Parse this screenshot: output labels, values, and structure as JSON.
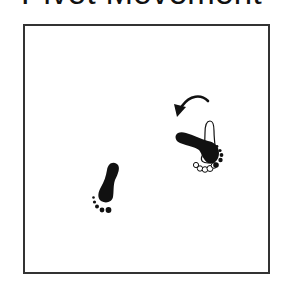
{
  "title": "Pivot Movement",
  "diagram": {
    "colors": {
      "ink": "#111111",
      "frame": "#333333",
      "background": "#ffffff"
    },
    "elements": [
      {
        "name": "rotation-arrow",
        "direction": "counterclockwise"
      },
      {
        "name": "pivot-foot-original-position",
        "style": "outline",
        "orientation": "heel-up"
      },
      {
        "name": "pivot-foot-new-position",
        "style": "filled",
        "orientation": "heel-left"
      },
      {
        "name": "planted-foot",
        "style": "filled",
        "orientation": "heel-up-right"
      }
    ]
  }
}
